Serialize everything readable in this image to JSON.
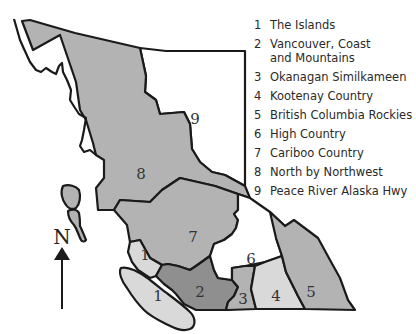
{
  "map": {
    "title": "British Columbia Tourism Regions",
    "colors": {
      "white": "#ffffff",
      "light": "#d9d9d9",
      "medium": "#b3b3b3",
      "dark": "#8f8f8f",
      "outline": "#1a1a1a"
    },
    "regions": [
      {
        "id": 1,
        "name": "The Islands",
        "shade": "light"
      },
      {
        "id": 2,
        "name": "Vancouver, Coast and Mountains",
        "shade": "dark"
      },
      {
        "id": 3,
        "name": "Okanagan Similkameen",
        "shade": "medium"
      },
      {
        "id": 4,
        "name": "Kootenay Country",
        "shade": "light"
      },
      {
        "id": 5,
        "name": "British Columbia Rockies",
        "shade": "medium"
      },
      {
        "id": 6,
        "name": "High Country",
        "shade": "white"
      },
      {
        "id": 7,
        "name": "Cariboo Country",
        "shade": "medium"
      },
      {
        "id": 8,
        "name": "North by Northwest",
        "shade": "medium"
      },
      {
        "id": 9,
        "name": "Peace River Alaska Hwy",
        "shade": "white"
      }
    ],
    "labels": {
      "r1a": "1",
      "r1b": "1",
      "r2": "2",
      "r3": "3",
      "r4": "4",
      "r5": "5",
      "r6": "6",
      "r7": "7",
      "r8": "8",
      "r9": "9"
    },
    "compass": {
      "label": "N",
      "icon": "north-arrow-icon"
    }
  },
  "legend": {
    "items": [
      {
        "num": "1",
        "text": "The Islands"
      },
      {
        "num": "2",
        "text": "Vancouver, Coast\nand Mountains"
      },
      {
        "num": "3",
        "text": "Okanagan Similkameen"
      },
      {
        "num": "4",
        "text": "Kootenay Country"
      },
      {
        "num": "5",
        "text": "British Columbia Rockies"
      },
      {
        "num": "6",
        "text": "High Country"
      },
      {
        "num": "7",
        "text": "Cariboo Country"
      },
      {
        "num": "8",
        "text": "North by Northwest"
      },
      {
        "num": "9",
        "text": "Peace River Alaska Hwy"
      }
    ]
  }
}
